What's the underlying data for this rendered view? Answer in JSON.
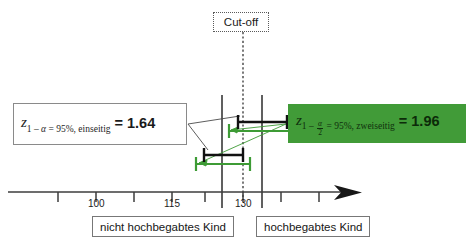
{
  "diagram": {
    "title_label": "Cut-off",
    "axis": {
      "tick_labels": [
        {
          "value": "100",
          "x": 96
        },
        {
          "value": "115",
          "x": 172
        },
        {
          "value": "130",
          "x": 243
        }
      ],
      "tick_positions": [
        58,
        96,
        134,
        172,
        205,
        243,
        281,
        319
      ],
      "axis_y": 192,
      "arrow_end_x": 355
    },
    "cutoff": {
      "label": "Cut-off",
      "line_x": 243
    },
    "region_labels": {
      "left": "nicht hochbegabtes Kind",
      "right": "hochbegabtes Kind"
    },
    "formula_one_sided": {
      "z": "z",
      "sub_prefix": "1 – ",
      "alpha": "α",
      "sub_rest": " = 95%, einseitig",
      "equals": "=",
      "value": "1.64"
    },
    "formula_two_sided": {
      "z": "z",
      "sub_prefix": "1 – ",
      "alpha_num": "α",
      "alpha_den": "2",
      "sub_rest": " = 95%, zweiseitig",
      "equals": "=",
      "value": "1.96"
    },
    "colors": {
      "green": "#419b38",
      "black": "#111111",
      "green_line": "#3d9b35",
      "axis": "#3c3c3c",
      "box_border": "#7d7d7d"
    },
    "intervals": [
      {
        "name": "upper-black-1.64",
        "color": "black",
        "y": 122,
        "x1": 238,
        "x2": 287
      },
      {
        "name": "upper-green-1.96",
        "color": "green",
        "y": 131,
        "x1": 229,
        "x2": 294
      },
      {
        "name": "lower-black-1.64",
        "color": "black",
        "y": 155,
        "x1": 204,
        "x2": 243
      },
      {
        "name": "lower-green-1.96",
        "color": "green",
        "y": 164,
        "x1": 196,
        "x2": 250
      }
    ],
    "boundary_lines": [
      {
        "x": 222
      },
      {
        "x": 262
      }
    ]
  }
}
